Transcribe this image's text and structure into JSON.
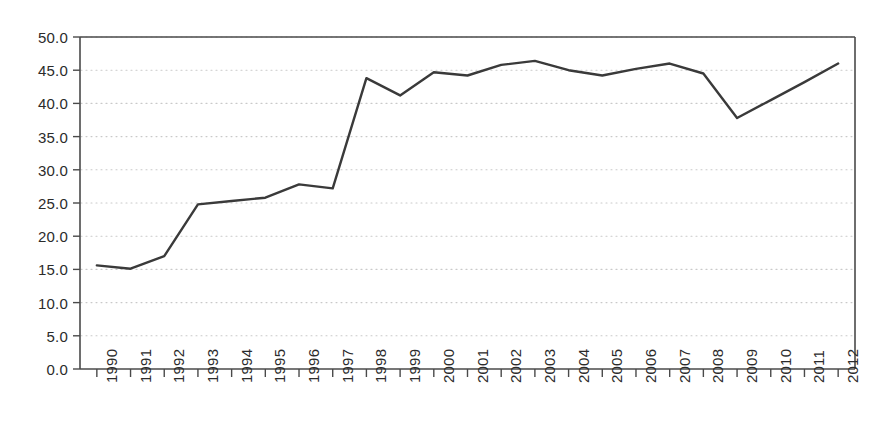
{
  "chart_data": {
    "type": "line",
    "title": "",
    "subtitle": "",
    "xlabel": "",
    "ylabel": "",
    "categories": [
      "1990",
      "1991",
      "1992",
      "1993",
      "1994",
      "1995",
      "1996",
      "1997",
      "1998",
      "1999",
      "2000",
      "2001",
      "2002",
      "2003",
      "2004",
      "2005",
      "2006",
      "2007",
      "2008",
      "2009",
      "2010",
      "2011",
      "2012"
    ],
    "values": [
      15.6,
      15.1,
      17.0,
      24.8,
      25.3,
      25.8,
      27.8,
      27.2,
      43.8,
      41.2,
      44.7,
      44.2,
      45.8,
      46.4,
      45.0,
      44.2,
      45.2,
      46.0,
      44.5,
      37.8,
      40.5,
      43.2,
      46.0
    ],
    "series": [
      {
        "name": "series-1",
        "values": [
          15.6,
          15.1,
          17.0,
          24.8,
          25.3,
          25.8,
          27.8,
          27.2,
          43.8,
          41.2,
          44.7,
          44.2,
          45.8,
          46.4,
          45.0,
          44.2,
          45.2,
          46.0,
          44.5,
          37.8,
          40.5,
          43.2,
          46.0
        ],
        "color": "#3a3a3a"
      }
    ],
    "ylim": [
      0.0,
      50.0
    ],
    "ytick_labels": [
      "0.0",
      "5.0",
      "10.0",
      "15.0",
      "20.0",
      "25.0",
      "30.0",
      "35.0",
      "40.0",
      "45.0",
      "50.0"
    ],
    "ytick_values": [
      0.0,
      5.0,
      10.0,
      15.0,
      20.0,
      25.0,
      30.0,
      35.0,
      40.0,
      45.0,
      50.0
    ],
    "xtick_labels": [
      "1990",
      "1991",
      "1992",
      "1993",
      "1994",
      "1995",
      "1996",
      "1997",
      "1998",
      "1999",
      "2000",
      "2001",
      "2002",
      "2003",
      "2004",
      "2005",
      "2006",
      "2007",
      "2008",
      "2009",
      "2010",
      "2011",
      "2012"
    ],
    "grid": true,
    "grid_axis": "y",
    "grid_style": "dotted",
    "legend": false,
    "legend_position": "none",
    "colors": {
      "line": "#3a3a3a",
      "axis": "#4a4a4a",
      "grid": "#c9c9c9",
      "text": "#2b2b2b",
      "background": "#ffffff"
    },
    "annotations": []
  }
}
